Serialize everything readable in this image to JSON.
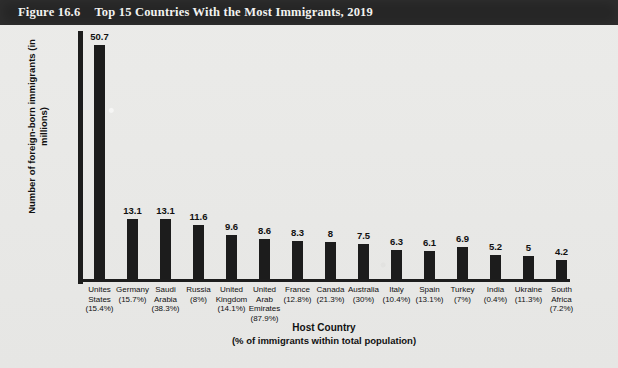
{
  "header": {
    "figure_number": "Figure 16.6",
    "title": "Top 15 Countries With the Most Immigrants, 2019"
  },
  "axis": {
    "y_title_line1": "Number of foreign-born",
    "y_title_line2": "immigrants (in millions)",
    "x_title": "Host Country",
    "x_subtitle": "(% of immigrants within total population)"
  },
  "colors": {
    "header_background": "#262626",
    "header_text": "#f2f2f0",
    "bar": "#1c1c1c",
    "axis": "#1d1d1d",
    "page_background": "#e9e9e7"
  },
  "chart_data": {
    "type": "bar",
    "title": "Top 15 Countries With the Most Immigrants, 2019",
    "xlabel": "Host Country (% of immigrants within total population)",
    "ylabel": "Number of foreign-born immigrants (in millions)",
    "ylim": [
      0,
      50.7
    ],
    "grid": false,
    "legend": false,
    "categories": [
      "Unites States",
      "Germany",
      "Saudi Arabia",
      "Russia",
      "United Kingdom",
      "United Arab Emirates",
      "France",
      "Canada",
      "Australia",
      "Italy",
      "Spain",
      "Turkey",
      "India",
      "Ukraine",
      "South Africa"
    ],
    "category_lines": [
      [
        "Unites",
        "States",
        "(15.4%)"
      ],
      [
        "Germany",
        "(15.7%)"
      ],
      [
        "Saudi",
        "Arabia",
        "(38.3%)"
      ],
      [
        "Russia",
        "(8%)"
      ],
      [
        "United",
        "Kingdom",
        "(14.1%)"
      ],
      [
        "United",
        "Arab",
        "Emirates",
        "(87.9%)"
      ],
      [
        "France",
        "(12.8%)"
      ],
      [
        "Canada",
        "(21.3%)"
      ],
      [
        "Australia",
        "(30%)"
      ],
      [
        "Italy",
        "(10.4%)"
      ],
      [
        "Spain",
        "(13.1%)"
      ],
      [
        "Turkey",
        "(7%)"
      ],
      [
        "India",
        "(0.4%)"
      ],
      [
        "Ukraine",
        "(11.3%)"
      ],
      [
        "South",
        "Africa",
        "(7.2%)"
      ]
    ],
    "percent_of_population": [
      "15.4%",
      "15.7%",
      "38.3%",
      "8%",
      "14.1%",
      "87.9%",
      "12.8%",
      "21.3%",
      "30%",
      "10.4%",
      "13.1%",
      "7%",
      "0.4%",
      "11.3%",
      "7.2%"
    ],
    "values": [
      50.7,
      13.1,
      13.1,
      11.6,
      9.6,
      8.6,
      8.3,
      8,
      7.5,
      6.3,
      6.1,
      6.9,
      5.2,
      5,
      4.2
    ],
    "value_labels": [
      "50.7",
      "13.1",
      "13.1",
      "11.6",
      "9.6",
      "8.6",
      "8.3",
      "8",
      "7.5",
      "6.3",
      "6.1",
      "6.9",
      "5.2",
      "5",
      "4.2"
    ]
  }
}
